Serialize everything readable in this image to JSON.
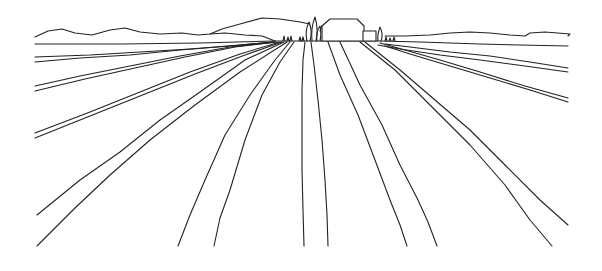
{
  "artwork": {
    "title": "Line drawing of plowed field furrows converging to a horizon with farmhouse and cypress trees",
    "stroke_color": "#222222",
    "background_color": "#ffffff",
    "elements": [
      "hills",
      "horizon",
      "farmhouse",
      "annex",
      "cypress-trees",
      "field-furrows"
    ]
  }
}
